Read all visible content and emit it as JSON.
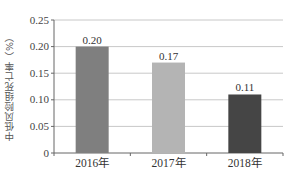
{
  "chart_data": {
    "type": "bar",
    "title": "",
    "xlabel": "",
    "ylabel": "中低风险组死亡率（%）",
    "categories": [
      "2016年",
      "2017年",
      "2018年"
    ],
    "values": [
      0.2,
      0.17,
      0.11
    ],
    "data_labels": [
      "0.20",
      "0.17",
      "0.11"
    ],
    "bar_colors": [
      "#7f7f7f",
      "#b4b4b4",
      "#454545"
    ],
    "ylim": [
      0,
      0.25
    ],
    "yticks": [
      0,
      0.05,
      0.1,
      0.15,
      0.2,
      0.25
    ],
    "ytick_labels": [
      "0",
      "0.05",
      "0.10",
      "0.15",
      "0.20",
      "0.25"
    ],
    "grid": true,
    "legend": "none"
  }
}
